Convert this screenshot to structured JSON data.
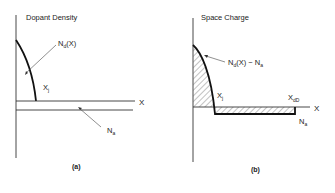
{
  "panel_a": {
    "title": "Dopant Density",
    "curve_label": "N",
    "curve_label_sub": "d",
    "curve_label_suffix": "(X)",
    "junction_label": "X",
    "junction_label_sub": "j",
    "axis_label": "X",
    "acceptor_label": "N",
    "acceptor_label_sub": "a",
    "caption": "(a)"
  },
  "panel_b": {
    "title": "Space Charge",
    "curve_label": "N",
    "curve_label_sub": "d",
    "curve_label_suffix": "(X) − N",
    "curve_label_sub2": "a",
    "junction_label": "X",
    "junction_label_sub": "j",
    "depletion_label": "X",
    "depletion_label_sub": "dD",
    "axis_label": "X",
    "acceptor_label": "N",
    "acceptor_label_sub": "a",
    "caption": "(b)"
  },
  "colors": {
    "line": "#222222",
    "thin_line": "#444444",
    "hatch": "#555555"
  }
}
